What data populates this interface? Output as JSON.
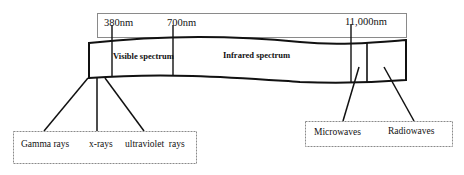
{
  "wavelength_markers": [
    {
      "label": "380nm"
    },
    {
      "label": "700nm"
    },
    {
      "label": "11,000nm"
    }
  ],
  "band_regions": [
    {
      "label": "Visible spectrum"
    },
    {
      "label": "Infrared spectrum"
    }
  ],
  "short_wave_group": {
    "items": [
      {
        "label": "Gamma rays"
      },
      {
        "label": "x-rays"
      },
      {
        "label": "ultraviolet  rays"
      }
    ]
  },
  "long_wave_group": {
    "items": [
      {
        "label": "Microwaves"
      },
      {
        "label": "Radiowaves"
      }
    ]
  },
  "colors": {
    "line": "#111111",
    "box_border": "#8a8a8a"
  }
}
